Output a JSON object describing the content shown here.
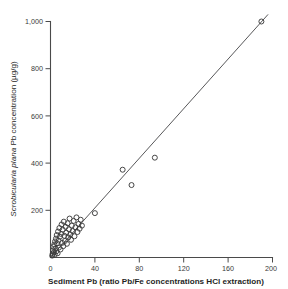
{
  "chart_data": {
    "type": "scatter",
    "title": "",
    "xlabel": "Sediment Pb (ratio Pb/Fe concentrations HCl extraction)",
    "ylabel": "Scrobicularia plana Pb concentration (µg/g)",
    "ylabel_italic_part": "Scrobicularia plana",
    "ylabel_roman_part": " Pb concentration (µg/g)",
    "xlim": [
      0,
      200
    ],
    "ylim": [
      0,
      1000
    ],
    "xticks": [
      0,
      40,
      80,
      120,
      160,
      200
    ],
    "yticks": [
      0,
      200,
      400,
      600,
      800,
      1000
    ],
    "xtick_labels": [
      "0",
      "40",
      "80",
      "120",
      "160",
      "200"
    ],
    "ytick_labels": [
      "0",
      "200",
      "400",
      "600",
      "800",
      "1,000"
    ],
    "grid": false,
    "legend": "none",
    "marker": "open-circle",
    "marker_color": "#3d3d3d",
    "line_color": "#58585a",
    "axis_color": "#4a4a4a",
    "series": [
      {
        "name": "Scrobicularia plana vs sediment Pb",
        "points": [
          [
            1.5,
            8
          ],
          [
            2.0,
            16
          ],
          [
            2.3,
            30
          ],
          [
            2.6,
            45
          ],
          [
            3.0,
            22
          ],
          [
            3.4,
            55
          ],
          [
            3.8,
            12
          ],
          [
            4.1,
            68
          ],
          [
            4.5,
            38
          ],
          [
            4.9,
            80
          ],
          [
            5.2,
            26
          ],
          [
            5.6,
            95
          ],
          [
            6.0,
            60
          ],
          [
            6.4,
            18
          ],
          [
            6.8,
            110
          ],
          [
            7.2,
            72
          ],
          [
            7.6,
            42
          ],
          [
            8.0,
            125
          ],
          [
            8.5,
            88
          ],
          [
            9.0,
            34
          ],
          [
            9.5,
            100
          ],
          [
            10.0,
            140
          ],
          [
            10.5,
            62
          ],
          [
            11.0,
            118
          ],
          [
            11.5,
            48
          ],
          [
            12.0,
            152
          ],
          [
            12.5,
            92
          ],
          [
            13.0,
            70
          ],
          [
            13.6,
            130
          ],
          [
            14.2,
            105
          ],
          [
            14.8,
            58
          ],
          [
            15.4,
            145
          ],
          [
            16.0,
            85
          ],
          [
            16.6,
            120
          ],
          [
            17.2,
            165
          ],
          [
            17.8,
            98
          ],
          [
            18.5,
            75
          ],
          [
            19.2,
            135
          ],
          [
            20.0,
            112
          ],
          [
            20.8,
            155
          ],
          [
            21.6,
            90
          ],
          [
            22.5,
            128
          ],
          [
            23.4,
            170
          ],
          [
            24.3,
            108
          ],
          [
            25.2,
            142
          ],
          [
            26.2,
            122
          ],
          [
            27.2,
            160
          ],
          [
            28.3,
            135
          ],
          [
            40.0,
            188
          ],
          [
            65.0,
            372
          ],
          [
            73.0,
            307
          ],
          [
            94.0,
            423
          ],
          [
            190.0,
            1000
          ]
        ]
      }
    ],
    "fit_line": {
      "type": "linear-regression",
      "from": [
        0,
        0
      ],
      "to": [
        196,
        1030
      ],
      "slope": 5.26,
      "intercept": 0
    }
  }
}
